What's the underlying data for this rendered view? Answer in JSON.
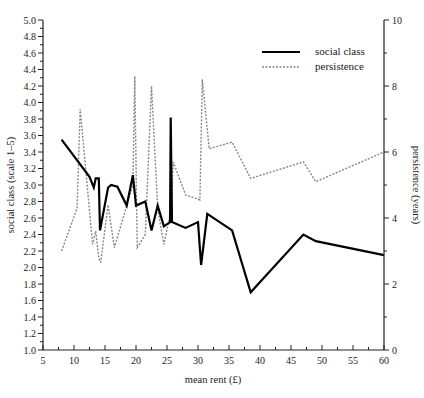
{
  "chart_data": {
    "type": "line",
    "title": "",
    "xlabel": "mean rent (£)",
    "ylabel": "social class (scale 1–5)",
    "y2label": "persistence (years)",
    "xlim": [
      5,
      60
    ],
    "ylim": [
      1.0,
      5.0
    ],
    "y2lim": [
      0,
      10
    ],
    "xticks": [
      5,
      10,
      15,
      20,
      25,
      30,
      35,
      40,
      45,
      50,
      55,
      60
    ],
    "yticks": [
      "1.0",
      "1.2",
      "1.4",
      "1.6",
      "1.8",
      "2.0",
      "2.2",
      "2.4",
      "2.6",
      "2.8",
      "3.0",
      "3.2",
      "3.4",
      "3.6",
      "3.8",
      "4.0",
      "4.2",
      "4.4",
      "4.6",
      "4.8",
      "5.0"
    ],
    "y2ticks": [
      0,
      2,
      4,
      6,
      8,
      10
    ],
    "grid": false,
    "legend_position": "upper right",
    "series": [
      {
        "name": "social class",
        "axis": "left",
        "style": "solid",
        "color": "#000000",
        "x": [
          8,
          12.5,
          13.2,
          13.5,
          14,
          14.2,
          15.5,
          16,
          17,
          18.5,
          19.5,
          20,
          21.5,
          22.5,
          23.5,
          24.5,
          25.5,
          25.6,
          25.8,
          28,
          30,
          30.5,
          31.5,
          35.5,
          38.5,
          47,
          49,
          60
        ],
        "values": [
          3.55,
          3.1,
          2.97,
          3.08,
          3.08,
          2.45,
          2.97,
          3.0,
          2.98,
          2.75,
          3.12,
          2.75,
          2.8,
          2.45,
          2.75,
          2.5,
          2.55,
          3.82,
          2.55,
          2.48,
          2.55,
          2.03,
          2.65,
          2.45,
          1.7,
          2.4,
          2.32,
          2.15
        ]
      },
      {
        "name": "persistence",
        "axis": "right",
        "style": "dashed",
        "color": "#888888",
        "x": [
          8,
          10.5,
          11,
          13,
          13.5,
          14,
          14.3,
          15.5,
          16.5,
          19.5,
          19.8,
          20.2,
          21.5,
          22.5,
          23.5,
          24.5,
          25.7,
          26,
          28,
          30.3,
          30.7,
          31.8,
          35.5,
          38.5,
          47,
          49,
          60
        ],
        "values": [
          3.0,
          4.3,
          7.3,
          3.2,
          3.6,
          2.8,
          2.65,
          4.4,
          3.1,
          5.0,
          8.3,
          3.1,
          3.5,
          8.0,
          4.3,
          3.2,
          4.3,
          5.7,
          4.7,
          4.55,
          8.2,
          6.1,
          6.3,
          5.2,
          5.7,
          5.1,
          6.0
        ]
      }
    ]
  },
  "legend": {
    "items": [
      {
        "label": "social class"
      },
      {
        "label": "persistence"
      }
    ]
  },
  "axes": {
    "x_title": "mean rent (£)",
    "y_left_title": "social class (scale 1–5)",
    "y_right_title": "persistence (years)"
  }
}
